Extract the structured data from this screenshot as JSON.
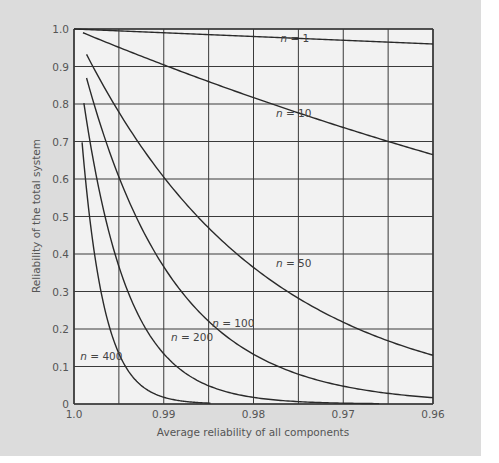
{
  "chart_data": {
    "type": "line",
    "title": "",
    "xlabel": "Average reliability of all components",
    "ylabel": "Reliability of the total system",
    "xlim": [
      1.0,
      0.96
    ],
    "ylim": [
      0,
      1.0
    ],
    "grid": true,
    "x_ticks": [
      {
        "value": 1.0,
        "label": "1.0"
      },
      {
        "value": 0.99,
        "label": "0.99"
      },
      {
        "value": 0.98,
        "label": "0.98"
      },
      {
        "value": 0.97,
        "label": "0.97"
      },
      {
        "value": 0.96,
        "label": "0.96"
      }
    ],
    "x_gridlines": [
      1.0,
      0.995,
      0.99,
      0.985,
      0.98,
      0.975,
      0.97,
      0.965,
      0.96
    ],
    "y_ticks": [
      {
        "value": 0,
        "label": "0"
      },
      {
        "value": 0.1,
        "label": "0.1"
      },
      {
        "value": 0.2,
        "label": "0.2"
      },
      {
        "value": 0.3,
        "label": "0.3"
      },
      {
        "value": 0.4,
        "label": "0.4"
      },
      {
        "value": 0.5,
        "label": "0.5"
      },
      {
        "value": 0.6,
        "label": "0.6"
      },
      {
        "value": 0.7,
        "label": "0.7"
      },
      {
        "value": 0.8,
        "label": "0.8"
      },
      {
        "value": 0.9,
        "label": "0.9"
      },
      {
        "value": 1.0,
        "label": "1.0"
      }
    ],
    "formula": "R = r^n",
    "series": [
      {
        "name": "n = 1",
        "n": 1,
        "label_n": "n",
        "label_rest": " = 1",
        "x_start": 1.0,
        "x_end": 0.96,
        "label_pos": [
          0.977,
          0.965
        ],
        "points": [
          [
            1.0,
            1.0
          ],
          [
            0.99,
            0.99
          ],
          [
            0.98,
            0.98
          ],
          [
            0.97,
            0.97
          ],
          [
            0.96,
            0.96
          ]
        ]
      },
      {
        "name": "n = 10",
        "n": 10,
        "label_n": "n",
        "label_rest": " = 10",
        "x_start": 0.999,
        "x_end": 0.96,
        "label_pos": [
          0.9775,
          0.765
        ],
        "points": [
          [
            1.0,
            0.99
          ],
          [
            0.99,
            0.904
          ],
          [
            0.98,
            0.817
          ],
          [
            0.97,
            0.737
          ],
          [
            0.96,
            0.665
          ]
        ]
      },
      {
        "name": "n = 50",
        "n": 50,
        "label_n": "n",
        "label_rest": " = 50",
        "x_start": 0.9986,
        "x_end": 0.96,
        "label_pos": [
          0.9775,
          0.365
        ],
        "points": [
          [
            0.9986,
            0.932
          ],
          [
            0.99,
            0.605
          ],
          [
            0.98,
            0.364
          ],
          [
            0.97,
            0.218
          ],
          [
            0.96,
            0.13
          ]
        ]
      },
      {
        "name": "n = 100",
        "n": 100,
        "label_n": "n",
        "label_rest": " = 100",
        "x_start": 0.9986,
        "x_end": 0.96,
        "label_pos": [
          0.9846,
          0.205
        ],
        "points": [
          [
            0.9986,
            0.869
          ],
          [
            0.99,
            0.366
          ],
          [
            0.98,
            0.133
          ],
          [
            0.97,
            0.048
          ],
          [
            0.96,
            0.017
          ]
        ]
      },
      {
        "name": "n = 200",
        "n": 200,
        "label_n": "n",
        "label_rest": " = 200",
        "x_start": 0.9989,
        "x_end": 0.966,
        "label_pos": [
          0.9892,
          0.168
        ],
        "points": [
          [
            0.9989,
            0.803
          ],
          [
            0.99,
            0.134
          ],
          [
            0.98,
            0.018
          ],
          [
            0.97,
            0.002
          ]
        ]
      },
      {
        "name": "n = 400",
        "n": 400,
        "label_n": "n",
        "label_rest": " = 400",
        "x_start": 0.9991,
        "x_end": 0.9848,
        "label_pos": [
          0.9993,
          0.117
        ],
        "points": [
          [
            0.9991,
            0.697
          ],
          [
            0.995,
            0.135
          ],
          [
            0.99,
            0.018
          ],
          [
            0.985,
            0.002
          ]
        ]
      }
    ]
  },
  "colors": {
    "panel_bg": "#dcdcdc",
    "plot_bg": "#f2f2f2",
    "grid": "#3a3a3a",
    "curve": "#2a2a2a",
    "text": "#555555"
  }
}
